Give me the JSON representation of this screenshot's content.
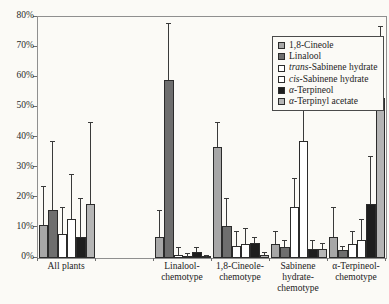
{
  "figure": {
    "width": 389,
    "height": 304,
    "background": "#fbfaf6"
  },
  "chart_data": {
    "type": "bar",
    "title": "",
    "xlabel": "",
    "ylabel": "",
    "ylim": [
      0,
      80
    ],
    "grid": false,
    "legend_position": "top-right-inside",
    "yticks": [
      "0%",
      "10%",
      "20%",
      "30%",
      "40%",
      "50%",
      "60%",
      "70%",
      "80%"
    ],
    "categories": [
      "All plants",
      "",
      "Linalool-chemotype",
      "1,8-Cineole-chemotype",
      "Sabinene hydrate-chemotype",
      "α-Terpineol-chemotype"
    ],
    "category_label_lines": [
      [
        "All plants"
      ],
      [],
      [
        "Linalool-",
        "chemotype"
      ],
      [
        "1,8-Cineole-",
        "chemotype"
      ],
      [
        "Sabinene",
        "hydrate-",
        "chemotype"
      ],
      [
        "α-Terpineol-",
        "chemotype"
      ]
    ],
    "series": [
      {
        "name": "1,8-Cineole",
        "color": "#a7a7a7",
        "values": [
          11,
          null,
          7,
          37,
          4.5,
          7
        ],
        "errors_top": [
          24,
          null,
          16,
          45,
          9,
          17
        ]
      },
      {
        "name": "Linalool",
        "color": "#6e6e6e",
        "values": [
          16,
          null,
          59,
          10.5,
          3.5,
          2.5
        ],
        "errors_top": [
          39,
          null,
          78,
          20,
          6,
          4
        ]
      },
      {
        "name": "trans-Sabinene hydrate",
        "color": "#ffffff",
        "values": [
          8,
          null,
          1,
          4,
          17,
          4.5
        ],
        "errors_top": [
          17,
          null,
          3.5,
          9,
          26.5,
          9
        ]
      },
      {
        "name": "cis-Sabinene hydrate",
        "color": "#ffffff",
        "values": [
          13,
          null,
          0.5,
          4.5,
          39,
          6
        ],
        "errors_top": [
          28,
          null,
          1.5,
          10,
          49,
          13
        ]
      },
      {
        "name": "α-Terpineol",
        "color": "#1e1e1e",
        "values": [
          7,
          null,
          2,
          5,
          3,
          18
        ],
        "errors_top": [
          20,
          null,
          3.5,
          7,
          6,
          34
        ]
      },
      {
        "name": "α-Terpinyl acetate",
        "color": "#b5b5b5",
        "values": [
          18,
          null,
          0.5,
          1,
          3,
          53
        ],
        "errors_top": [
          45,
          null,
          1,
          2,
          5,
          77
        ]
      }
    ],
    "legend_entries": [
      {
        "segments": [
          {
            "t": "1,8-Cineole",
            "i": false
          }
        ]
      },
      {
        "segments": [
          {
            "t": "Linalool",
            "i": false
          }
        ]
      },
      {
        "segments": [
          {
            "t": "trans",
            "i": true
          },
          {
            "t": "-Sabinene hydrate",
            "i": false
          }
        ]
      },
      {
        "segments": [
          {
            "t": "cis",
            "i": true
          },
          {
            "t": "-Sabinene hydrate",
            "i": false
          }
        ]
      },
      {
        "segments": [
          {
            "t": "α",
            "i": true
          },
          {
            "t": "-Terpineol",
            "i": false
          }
        ]
      },
      {
        "segments": [
          {
            "t": "α",
            "i": true
          },
          {
            "t": "-Terpinyl acetate",
            "i": false
          }
        ]
      }
    ]
  },
  "geometry": {
    "plot_left": 37,
    "plot_top": 16,
    "plot_width": 348,
    "plot_height": 241
  }
}
